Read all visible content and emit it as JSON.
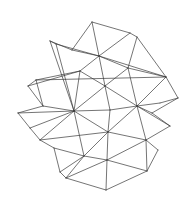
{
  "figure": {
    "background_color": "#ffffff",
    "line_color": "#3a3a3a",
    "vertices": {
      "A": [
        92,
        22
      ],
      "B": [
        50,
        41
      ],
      "C": [
        56,
        44
      ],
      "D": [
        130,
        33
      ],
      "E": [
        137,
        37
      ],
      "F": [
        99,
        56
      ],
      "G": [
        166,
        77
      ],
      "H": [
        36,
        80
      ],
      "I": [
        28,
        86
      ],
      "J": [
        18,
        113
      ],
      "K": [
        74,
        111
      ],
      "L": [
        105,
        86
      ],
      "M": [
        110,
        110
      ],
      "N": [
        137,
        106
      ],
      "O": [
        178,
        98
      ],
      "P": [
        108,
        132
      ],
      "Q": [
        107,
        160
      ],
      "R": [
        106,
        190
      ],
      "S": [
        66,
        178
      ],
      "T": [
        147,
        171
      ],
      "U": [
        80,
        71
      ],
      "V": [
        43,
        106
      ],
      "W": [
        40,
        140
      ],
      "X": [
        30,
        128
      ],
      "Y": [
        170,
        126
      ],
      "Z": [
        160,
        103
      ],
      "a": [
        146,
        140
      ],
      "b": [
        158,
        150
      ],
      "c": [
        54,
        148
      ],
      "d": [
        60,
        172
      ],
      "e": [
        84,
        156
      ],
      "f": [
        128,
        68
      ],
      "g": [
        152,
        113
      ],
      "h": [
        72,
        50
      ]
    },
    "edges": [
      [
        "A",
        "h"
      ],
      [
        "A",
        "F"
      ],
      [
        "A",
        "D"
      ],
      [
        "h",
        "F"
      ],
      [
        "B",
        "h"
      ],
      [
        "B",
        "K"
      ],
      [
        "C",
        "F"
      ],
      [
        "C",
        "K"
      ],
      [
        "B",
        "C"
      ],
      [
        "D",
        "E"
      ],
      [
        "D",
        "F"
      ],
      [
        "E",
        "G"
      ],
      [
        "F",
        "G"
      ],
      [
        "E",
        "f"
      ],
      [
        "F",
        "f"
      ],
      [
        "F",
        "L"
      ],
      [
        "F",
        "U"
      ],
      [
        "U",
        "L"
      ],
      [
        "U",
        "K"
      ],
      [
        "U",
        "H"
      ],
      [
        "H",
        "G"
      ],
      [
        "I",
        "U"
      ],
      [
        "I",
        "H"
      ],
      [
        "I",
        "V"
      ],
      [
        "H",
        "V"
      ],
      [
        "J",
        "V"
      ],
      [
        "J",
        "K"
      ],
      [
        "V",
        "K"
      ],
      [
        "J",
        "X"
      ],
      [
        "X",
        "K"
      ],
      [
        "X",
        "W"
      ],
      [
        "W",
        "K"
      ],
      [
        "K",
        "L"
      ],
      [
        "K",
        "M"
      ],
      [
        "L",
        "M"
      ],
      [
        "L",
        "N"
      ],
      [
        "L",
        "f"
      ],
      [
        "f",
        "N"
      ],
      [
        "f",
        "G"
      ],
      [
        "G",
        "N"
      ],
      [
        "G",
        "O"
      ],
      [
        "O",
        "Z"
      ],
      [
        "Z",
        "N"
      ],
      [
        "O",
        "g"
      ],
      [
        "g",
        "N"
      ],
      [
        "g",
        "Y"
      ],
      [
        "Y",
        "a"
      ],
      [
        "a",
        "N"
      ],
      [
        "M",
        "N"
      ],
      [
        "M",
        "P"
      ],
      [
        "N",
        "P"
      ],
      [
        "K",
        "P"
      ],
      [
        "K",
        "e"
      ],
      [
        "e",
        "P"
      ],
      [
        "W",
        "P"
      ],
      [
        "W",
        "c"
      ],
      [
        "c",
        "e"
      ],
      [
        "c",
        "d"
      ],
      [
        "d",
        "e"
      ],
      [
        "e",
        "S"
      ],
      [
        "S",
        "Q"
      ],
      [
        "d",
        "S"
      ],
      [
        "e",
        "Q"
      ],
      [
        "P",
        "Q"
      ],
      [
        "Q",
        "R"
      ],
      [
        "S",
        "R"
      ],
      [
        "Q",
        "T"
      ],
      [
        "R",
        "T"
      ],
      [
        "P",
        "a"
      ],
      [
        "a",
        "Q"
      ],
      [
        "a",
        "b"
      ],
      [
        "b",
        "T"
      ],
      [
        "a",
        "T"
      ],
      [
        "N",
        "Y"
      ]
    ]
  }
}
